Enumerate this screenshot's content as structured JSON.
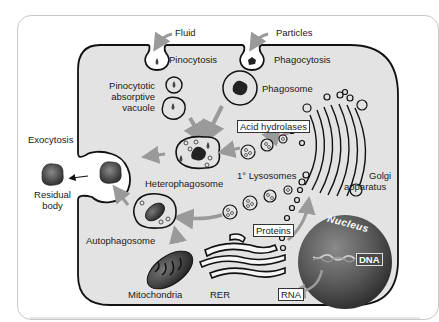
{
  "diagram": {
    "type": "cell-lysosome-pathways",
    "colors": {
      "cytoplasm": "#e3e3e3",
      "membrane": "#111111",
      "arrow": "#9a9a9a",
      "nucleus": "#555555",
      "background": "#ffffff"
    },
    "labels": {
      "fluid": "Fluid",
      "particles": "Particles",
      "pinocytosis": "Pinocytosis",
      "phagocytosis": "Phagocytosis",
      "pinocytotic_line1": "Pinocytotic",
      "pinocytotic_line2": "absorptive",
      "pinocytotic_line3": "vacuole",
      "phagosome": "Phagosome",
      "acid_hydrolases": "Acid hydrolases",
      "exocytosis": "Exocytosis",
      "residual_line1": "Residual",
      "residual_line2": "body",
      "heterophagosome": "Heterophagosome",
      "primary_lysosomes": "1° Lysosomes",
      "golgi_line1": "Golgi",
      "golgi_line2": "apparatus",
      "autophagosome": "Autophagosome",
      "proteins": "Proteins",
      "nucleus": "Nucleus",
      "dna": "DNA",
      "mitochondria": "Mitochondria",
      "rer": "RER",
      "rna": "RNA"
    }
  }
}
